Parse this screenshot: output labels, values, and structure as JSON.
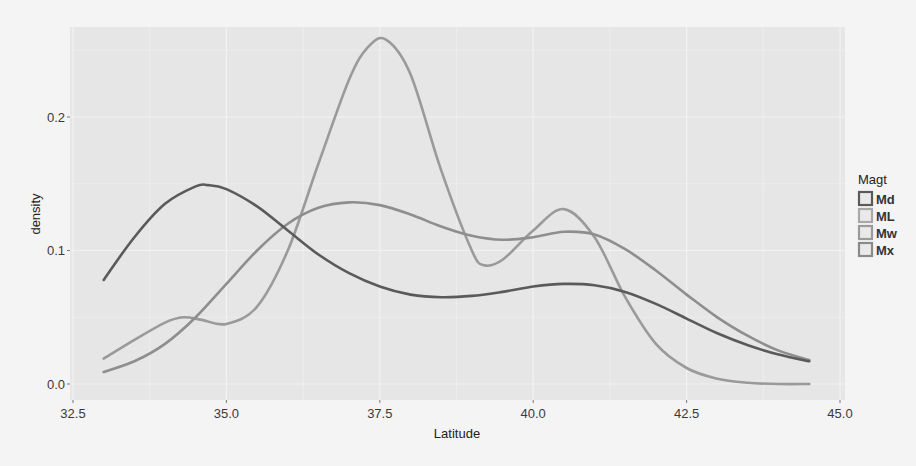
{
  "chart_data": {
    "type": "line",
    "subtype": "density",
    "title": "",
    "xlabel": "Latitude",
    "ylabel": "density",
    "xlim": [
      32.5,
      45.0
    ],
    "ylim": [
      -0.006,
      0.27
    ],
    "x_ticks": [
      32.5,
      35.0,
      37.5,
      40.0,
      42.5,
      45.0
    ],
    "x_tick_labels": [
      "32.5",
      "35.0",
      "37.5",
      "40.0",
      "42.5",
      "45.0"
    ],
    "y_ticks": [
      0.0,
      0.1,
      0.2
    ],
    "y_tick_labels": [
      "0.0",
      "0.1",
      "0.2"
    ],
    "grid": true,
    "legend": {
      "title": "Magt",
      "position": "right",
      "entries": [
        "Md",
        "ML",
        "Mw",
        "Mx"
      ]
    },
    "series": [
      {
        "name": "Md",
        "color": "#5a5a5a",
        "x": [
          33.0,
          33.5,
          34.0,
          34.5,
          34.7,
          35.0,
          35.5,
          36.0,
          36.5,
          37.0,
          37.5,
          38.0,
          38.5,
          39.0,
          39.5,
          40.0,
          40.5,
          41.0,
          41.5,
          42.0,
          42.5,
          43.0,
          43.5,
          44.0,
          44.5
        ],
        "values": [
          0.078,
          0.11,
          0.135,
          0.148,
          0.149,
          0.146,
          0.133,
          0.115,
          0.097,
          0.083,
          0.073,
          0.067,
          0.065,
          0.066,
          0.069,
          0.073,
          0.075,
          0.074,
          0.069,
          0.06,
          0.049,
          0.038,
          0.029,
          0.022,
          0.017
        ]
      },
      {
        "name": "ML",
        "color": "#8e8e8e",
        "x": [
          33.0,
          33.5,
          34.0,
          34.5,
          35.0,
          35.5,
          36.0,
          36.5,
          37.0,
          37.5,
          38.0,
          38.5,
          39.0,
          39.5,
          40.0,
          40.5,
          41.0,
          41.5,
          42.0,
          42.5,
          43.0,
          43.5,
          44.0,
          44.5
        ],
        "values": [
          0.009,
          0.017,
          0.03,
          0.05,
          0.075,
          0.1,
          0.12,
          0.132,
          0.136,
          0.134,
          0.127,
          0.118,
          0.111,
          0.108,
          0.11,
          0.114,
          0.112,
          0.101,
          0.085,
          0.067,
          0.05,
          0.036,
          0.025,
          0.018
        ]
      },
      {
        "name": "Mw",
        "color": "#9a9a9a",
        "x": [
          33.0,
          33.5,
          34.0,
          34.3,
          34.6,
          35.0,
          35.5,
          36.0,
          36.5,
          37.0,
          37.3,
          37.6,
          38.0,
          38.5,
          39.0,
          39.2,
          39.5,
          40.0,
          40.5,
          41.0,
          41.5,
          42.0,
          42.5,
          43.0,
          43.5,
          44.0,
          44.5
        ],
        "values": [
          0.019,
          0.033,
          0.046,
          0.05,
          0.048,
          0.045,
          0.058,
          0.1,
          0.165,
          0.228,
          0.252,
          0.258,
          0.232,
          0.16,
          0.1,
          0.089,
          0.093,
          0.115,
          0.131,
          0.11,
          0.065,
          0.03,
          0.012,
          0.004,
          0.001,
          0.0,
          0.0
        ]
      },
      {
        "name": "Mx",
        "color": "#a5a5a5",
        "x": [],
        "values": []
      }
    ]
  },
  "legend_colors": {
    "Md": "#5a5a5a",
    "ML": "#a8a8a8",
    "Mw": "#9a9a9a",
    "Mx": "#8a8a8a"
  },
  "panel_background": "#e6e6e6",
  "grid_color": "#f2f2f2"
}
